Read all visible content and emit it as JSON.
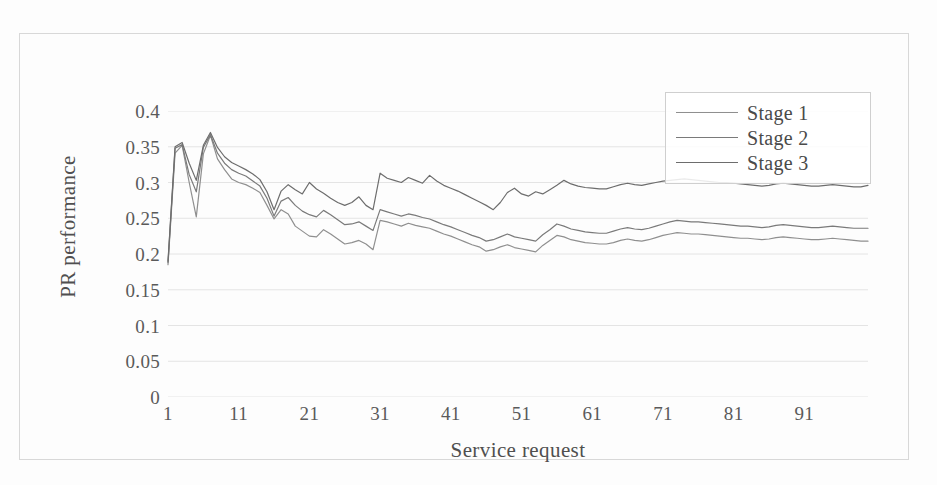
{
  "chart_data": {
    "type": "line",
    "title": "",
    "xlabel": "Service request",
    "ylabel": "PR performance",
    "xlim": [
      1,
      100
    ],
    "ylim": [
      0,
      0.4
    ],
    "grid": true,
    "legend_position": "top-right",
    "x_ticks": [
      "1",
      "11",
      "21",
      "31",
      "41",
      "51",
      "61",
      "71",
      "81",
      "91"
    ],
    "x_tick_values": [
      1,
      11,
      21,
      31,
      41,
      51,
      61,
      71,
      81,
      91
    ],
    "y_ticks": [
      "0",
      "0.05",
      "0.1",
      "0.15",
      "0.2",
      "0.25",
      "0.3",
      "0.35",
      "0.4"
    ],
    "y_tick_values": [
      0,
      0.05,
      0.1,
      0.15,
      0.2,
      0.25,
      0.3,
      0.35,
      0.4
    ],
    "x": [
      1,
      2,
      3,
      4,
      5,
      6,
      7,
      8,
      9,
      10,
      11,
      12,
      13,
      14,
      15,
      16,
      17,
      18,
      19,
      20,
      21,
      22,
      23,
      24,
      25,
      26,
      27,
      28,
      29,
      30,
      31,
      32,
      33,
      34,
      35,
      36,
      37,
      38,
      39,
      40,
      41,
      42,
      43,
      44,
      45,
      46,
      47,
      48,
      49,
      50,
      51,
      52,
      53,
      54,
      55,
      56,
      57,
      58,
      59,
      60,
      61,
      62,
      63,
      64,
      65,
      66,
      67,
      68,
      69,
      70,
      71,
      72,
      73,
      74,
      75,
      76,
      77,
      78,
      79,
      80,
      81,
      82,
      83,
      84,
      85,
      86,
      87,
      88,
      89,
      90,
      91,
      92,
      93,
      94,
      95,
      96,
      97,
      98,
      99,
      100
    ],
    "series": [
      {
        "name": "Stage 1",
        "color": "#8f8f8f",
        "values": [
          0.185,
          0.341,
          0.352,
          0.3,
          0.252,
          0.34,
          0.366,
          0.333,
          0.318,
          0.305,
          0.3,
          0.297,
          0.292,
          0.286,
          0.268,
          0.249,
          0.262,
          0.256,
          0.239,
          0.232,
          0.225,
          0.224,
          0.234,
          0.228,
          0.221,
          0.214,
          0.216,
          0.219,
          0.214,
          0.206,
          0.247,
          0.245,
          0.242,
          0.239,
          0.243,
          0.24,
          0.238,
          0.236,
          0.232,
          0.228,
          0.225,
          0.221,
          0.217,
          0.213,
          0.21,
          0.204,
          0.206,
          0.21,
          0.213,
          0.209,
          0.207,
          0.205,
          0.203,
          0.212,
          0.219,
          0.226,
          0.224,
          0.22,
          0.218,
          0.216,
          0.215,
          0.214,
          0.214,
          0.216,
          0.219,
          0.221,
          0.219,
          0.218,
          0.22,
          0.223,
          0.226,
          0.228,
          0.23,
          0.229,
          0.228,
          0.228,
          0.227,
          0.226,
          0.225,
          0.224,
          0.223,
          0.222,
          0.222,
          0.221,
          0.22,
          0.221,
          0.223,
          0.224,
          0.223,
          0.222,
          0.221,
          0.22,
          0.22,
          0.221,
          0.222,
          0.221,
          0.22,
          0.219,
          0.218,
          0.218
        ]
      },
      {
        "name": "Stage 2",
        "color": "#7a7a7a",
        "values": [
          0.188,
          0.348,
          0.353,
          0.311,
          0.287,
          0.349,
          0.367,
          0.341,
          0.327,
          0.318,
          0.313,
          0.309,
          0.302,
          0.295,
          0.278,
          0.253,
          0.274,
          0.279,
          0.268,
          0.26,
          0.255,
          0.252,
          0.261,
          0.255,
          0.248,
          0.241,
          0.242,
          0.245,
          0.239,
          0.233,
          0.262,
          0.259,
          0.256,
          0.253,
          0.256,
          0.254,
          0.251,
          0.249,
          0.245,
          0.241,
          0.238,
          0.234,
          0.23,
          0.226,
          0.223,
          0.218,
          0.22,
          0.224,
          0.228,
          0.224,
          0.222,
          0.22,
          0.218,
          0.227,
          0.234,
          0.242,
          0.239,
          0.235,
          0.233,
          0.231,
          0.23,
          0.229,
          0.229,
          0.232,
          0.235,
          0.237,
          0.235,
          0.234,
          0.236,
          0.239,
          0.242,
          0.245,
          0.247,
          0.246,
          0.245,
          0.245,
          0.244,
          0.243,
          0.242,
          0.241,
          0.24,
          0.239,
          0.239,
          0.238,
          0.237,
          0.238,
          0.24,
          0.241,
          0.24,
          0.239,
          0.238,
          0.237,
          0.237,
          0.238,
          0.239,
          0.238,
          0.237,
          0.236,
          0.236,
          0.236
        ]
      },
      {
        "name": "Stage 3",
        "color": "#6d6d6d",
        "values": [
          0.19,
          0.35,
          0.356,
          0.327,
          0.303,
          0.352,
          0.37,
          0.349,
          0.336,
          0.328,
          0.323,
          0.318,
          0.312,
          0.304,
          0.287,
          0.262,
          0.288,
          0.297,
          0.29,
          0.284,
          0.3,
          0.291,
          0.285,
          0.278,
          0.272,
          0.268,
          0.272,
          0.28,
          0.268,
          0.262,
          0.313,
          0.306,
          0.303,
          0.3,
          0.307,
          0.303,
          0.299,
          0.31,
          0.302,
          0.296,
          0.292,
          0.288,
          0.283,
          0.278,
          0.273,
          0.268,
          0.262,
          0.272,
          0.286,
          0.292,
          0.284,
          0.281,
          0.287,
          0.284,
          0.29,
          0.296,
          0.303,
          0.298,
          0.295,
          0.293,
          0.292,
          0.291,
          0.291,
          0.294,
          0.297,
          0.299,
          0.297,
          0.296,
          0.298,
          0.3,
          0.302,
          0.303,
          0.304,
          0.305,
          0.304,
          0.303,
          0.302,
          0.301,
          0.3,
          0.3,
          0.299,
          0.298,
          0.297,
          0.296,
          0.295,
          0.296,
          0.298,
          0.299,
          0.298,
          0.297,
          0.296,
          0.295,
          0.295,
          0.296,
          0.297,
          0.296,
          0.295,
          0.294,
          0.294,
          0.296
        ]
      }
    ]
  },
  "legend": {
    "items": [
      {
        "label": "Stage 1",
        "color": "#8f8f8f"
      },
      {
        "label": "Stage 2",
        "color": "#7a7a7a"
      },
      {
        "label": "Stage 3",
        "color": "#6d6d6d"
      }
    ]
  },
  "colors": {
    "grid": "#e4e4e4",
    "frame": "#d8d8d8",
    "legend_border": "#cfcfcf",
    "text": "#5a5a5a",
    "background": "#fdfdfd"
  }
}
